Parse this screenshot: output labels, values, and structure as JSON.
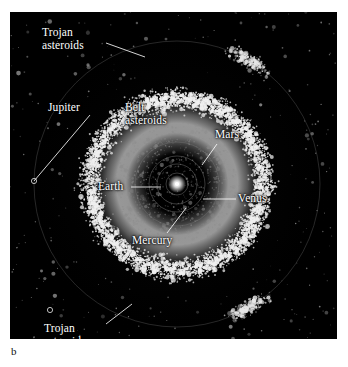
{
  "figure": {
    "caption_letter": "b",
    "panel_background": "#000000",
    "page_background": "#ffffff"
  },
  "chart_data": {
    "type": "scatter",
    "title": "",
    "subtitle": "",
    "xlabel": "",
    "ylabel": "",
    "projection": "top-down ecliptic plane view of the inner Solar System",
    "grid": false,
    "legend_position": "none",
    "center_object": {
      "name": "Sun",
      "cx": 167,
      "cy": 172,
      "color": "#ffffff"
    },
    "orbit_rings": [
      {
        "name": "Mercury orbit",
        "radius": 11,
        "color": "#6d6d6d"
      },
      {
        "name": "Venus orbit",
        "radius": 20,
        "color": "#6d6d6d"
      },
      {
        "name": "Earth orbit",
        "radius": 28,
        "color": "#6d6d6d"
      },
      {
        "name": "Mars orbit",
        "radius": 42,
        "color": "#6d6d6d"
      },
      {
        "name": "Jupiter orbit",
        "radius": 143,
        "color": "#5a5a5a"
      }
    ],
    "belt": {
      "name": "Main asteroid belt",
      "inner_radius": 62,
      "outer_radius": 112,
      "peak_radius": 86,
      "point_count": 5200,
      "color": "#f0f0f0",
      "description": "dense bright annulus of main-belt asteroids between Mars and Jupiter"
    },
    "inner_region": {
      "name": "Inner planet region",
      "outer_radius": 62,
      "point_count": 900,
      "color": "#8c8c8c",
      "description": "sparse dark scatter of near-Earth and Mars-crossing asteroids"
    },
    "trojan_clusters": [
      {
        "name": "Trojan asteroids (leading L4)",
        "angle_degrees": 60,
        "radius": 143,
        "point_count": 260,
        "color": "#e8e8e8"
      },
      {
        "name": "Trojan asteroids (trailing L5)",
        "angle_degrees": -60,
        "radius": 143,
        "point_count": 260,
        "color": "#e8e8e8"
      }
    ],
    "background_field": {
      "name": "scattered outer asteroids",
      "point_count": 420,
      "color": "#9a9a9a"
    },
    "annotations": [
      {
        "label": "Trojan asteroids",
        "lines": [
          "Trojan",
          "asteroids"
        ],
        "text_x": 32,
        "text_y": 14,
        "leader_from_x": 96,
        "leader_from_y": 31,
        "leader_to_x": 135,
        "leader_to_y": 45
      },
      {
        "label": "Jupiter",
        "lines": [
          "Jupiter"
        ],
        "text_x": 38,
        "text_y": 89,
        "leader_from_x": 80,
        "leader_from_y": 103,
        "leader_to_x": 24,
        "leader_to_y": 169
      },
      {
        "label": "Belt asteroids",
        "lines": [
          "Belt",
          "asteroids"
        ],
        "text_x": 115,
        "text_y": 89,
        "leader_from_x": 0,
        "leader_from_y": 0,
        "leader_to_x": 0,
        "leader_to_y": 0
      },
      {
        "label": "Mars",
        "lines": [
          "Mars"
        ],
        "text_x": 205,
        "text_y": 116,
        "leader_from_x": 207,
        "leader_from_y": 132,
        "leader_to_x": 192,
        "leader_to_y": 153
      },
      {
        "label": "Earth",
        "lines": [
          "Earth"
        ],
        "text_x": 88,
        "text_y": 168,
        "leader_from_x": 121,
        "leader_from_y": 175,
        "leader_to_x": 151,
        "leader_to_y": 175
      },
      {
        "label": "Venus",
        "lines": [
          "Venus"
        ],
        "text_x": 228,
        "text_y": 180,
        "leader_from_x": 226,
        "leader_from_y": 187,
        "leader_to_x": 193,
        "leader_to_y": 187
      },
      {
        "label": "Mercury",
        "lines": [
          "Mercury"
        ],
        "text_x": 122,
        "text_y": 222,
        "leader_from_x": 157,
        "leader_from_y": 221,
        "leader_to_x": 176,
        "leader_to_y": 196
      },
      {
        "label": "Trojan asteroids",
        "lines": [
          "Trojan",
          "asteroids"
        ],
        "text_x": 34,
        "text_y": 310,
        "leader_from_x": 96,
        "leader_from_y": 312,
        "leader_to_x": 122,
        "leader_to_y": 292
      }
    ],
    "markers": [
      {
        "name": "Jupiter position marker",
        "cx": 24,
        "cy": 169,
        "r": 2.6
      },
      {
        "name": "Trojan cluster marker",
        "cx": 40,
        "cy": 298,
        "r": 2.6
      }
    ]
  },
  "labels": {
    "trojan_top_line1": "Trojan",
    "trojan_top_line2": "asteroids",
    "jupiter": "Jupiter",
    "belt_line1": "Belt",
    "belt_line2": "asteroids",
    "mars": "Mars",
    "earth": "Earth",
    "venus": "Venus",
    "mercury": "Mercury",
    "trojan_bottom_line1": "Trojan",
    "trojan_bottom_line2": "asteroids"
  }
}
